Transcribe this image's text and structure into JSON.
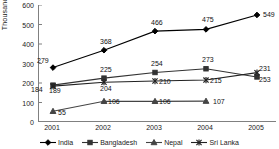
{
  "chart_data": {
    "type": "line",
    "title": "",
    "xlabel": "",
    "ylabel": "Thousands",
    "ylim": [
      0,
      600
    ],
    "ytick_labels": [
      "600",
      "500",
      "400",
      "300",
      "200",
      "100",
      "0"
    ],
    "ytick_values": [
      600,
      500,
      400,
      300,
      200,
      100,
      0
    ],
    "grid": false,
    "legend_position": "bottom",
    "categories": [
      "2001",
      "2002",
      "2003",
      "2004",
      "2005"
    ],
    "series": [
      {
        "name": "India",
        "marker": "diamond",
        "color": "#000000",
        "values": [
          279,
          368,
          466,
          475,
          549
        ],
        "labels": [
          "279",
          "368",
          "466",
          "475",
          "549"
        ]
      },
      {
        "name": "Bangladesh",
        "marker": "square",
        "color": "#333333",
        "values": [
          189,
          225,
          254,
          273,
          231
        ],
        "labels": [
          "189",
          "225",
          "254",
          "273",
          "231"
        ]
      },
      {
        "name": "Nepal",
        "marker": "triangle",
        "color": "#444444",
        "values": [
          55,
          106,
          106,
          107,
          null
        ],
        "labels": [
          "55",
          "106",
          "106",
          "107",
          ""
        ]
      },
      {
        "name": "Sri Lanka",
        "marker": "cross",
        "color": "#222222",
        "values": [
          184,
          204,
          210,
          215,
          253
        ],
        "labels": [
          "184",
          "204",
          "210",
          "215",
          "253"
        ]
      }
    ]
  },
  "legend": {
    "items": [
      {
        "label": "India"
      },
      {
        "label": "Bangladesh"
      },
      {
        "label": "Nepal"
      },
      {
        "label": "Sri Lanka"
      }
    ]
  },
  "axis": {
    "y_title": "Thousands"
  }
}
